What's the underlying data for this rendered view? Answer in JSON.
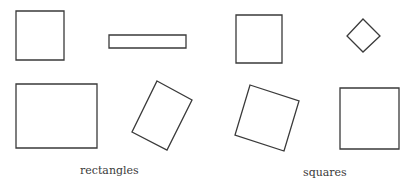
{
  "diagram": {
    "stroke_color": "#3a3a3a",
    "background": "#ffffff",
    "groups": [
      {
        "label": "rectangles",
        "shapes": [
          {
            "id": "square-upright",
            "kind": "rect",
            "points": "16,11 64,11 64,60 16,60"
          },
          {
            "id": "thin-bar",
            "kind": "rect",
            "points": "109,35 186,35 186,48 109,48"
          },
          {
            "id": "wide-rect",
            "kind": "rect",
            "points": "16,84 97,84 97,148 16,148"
          },
          {
            "id": "tilted-rect",
            "kind": "rect",
            "points": "157,81 192,100 167,150 132,132"
          }
        ]
      },
      {
        "label": "squares",
        "shapes": [
          {
            "id": "square-upright",
            "kind": "square",
            "points": "236,15 282,15 282,63 236,63"
          },
          {
            "id": "diamond",
            "kind": "square",
            "points": "363,19 380,36 363,52 347,36"
          },
          {
            "id": "tilted-square",
            "kind": "square",
            "points": "250,85 299,101 284,151 235,135"
          },
          {
            "id": "square-large",
            "kind": "square",
            "points": "340,88 399,88 399,149 340,149"
          }
        ]
      }
    ]
  }
}
